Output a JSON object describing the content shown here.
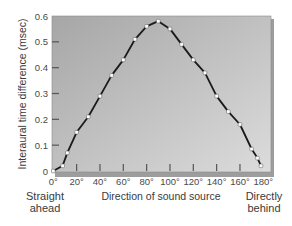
{
  "chart_data": {
    "type": "line",
    "title": "",
    "xlabel": "Direction of sound source",
    "ylabel": "Interaural time difference (msec)",
    "xlim": [
      0,
      180
    ],
    "ylim": [
      0,
      0.6
    ],
    "grid": false,
    "legend": null,
    "x_ticks": [
      0,
      20,
      40,
      60,
      80,
      100,
      120,
      140,
      160,
      180
    ],
    "x_tick_labels": [
      "0°",
      "20°",
      "40°",
      "60°",
      "80°",
      "100°",
      "120°",
      "140°",
      "160°",
      "180°"
    ],
    "y_ticks": [
      0,
      0.1,
      0.2,
      0.3,
      0.4,
      0.5,
      0.6
    ],
    "y_tick_labels": [
      "0",
      "0.1",
      "0.2",
      "0.3",
      "0.4",
      "0.5",
      "0.6"
    ],
    "annotations": {
      "left": [
        "Straight",
        "ahead"
      ],
      "right": [
        "Directly",
        "behind"
      ]
    },
    "series": [
      {
        "name": "Interaural time difference",
        "x": [
          0,
          8,
          12,
          20,
          30,
          40,
          50,
          60,
          70,
          80,
          90,
          100,
          110,
          120,
          130,
          140,
          150,
          160,
          170,
          175,
          178
        ],
        "values": [
          0.0,
          0.02,
          0.07,
          0.15,
          0.21,
          0.29,
          0.37,
          0.43,
          0.51,
          0.56,
          0.58,
          0.55,
          0.49,
          0.43,
          0.38,
          0.29,
          0.23,
          0.18,
          0.085,
          0.05,
          0.02
        ]
      }
    ]
  },
  "colors": {
    "plot_bg_dark": "#a9a9a9",
    "plot_bg_light": "#d8d8d8",
    "line": "#1a1a1a",
    "marker_fill": "#ffffff",
    "frame_shadow": "#9a9a9a"
  }
}
